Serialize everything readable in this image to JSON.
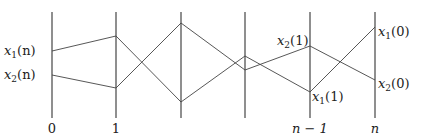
{
  "diagram": {
    "type": "parallel-coordinates / trajectory crossing diagram",
    "axes": [
      {
        "x": 52,
        "label": "0"
      },
      {
        "x": 116,
        "label": "1"
      },
      {
        "x": 181,
        "label": ""
      },
      {
        "x": 245,
        "label": ""
      },
      {
        "x": 310,
        "label": "n − 1"
      },
      {
        "x": 375,
        "label": "n"
      }
    ],
    "axis_top": 12,
    "axis_bottom": 118,
    "series": [
      {
        "name": "path-a",
        "points_y": [
          51,
          36,
          102,
          56,
          92,
          27
        ]
      },
      {
        "name": "path-b",
        "points_y": [
          75,
          88,
          23,
          70,
          46,
          80
        ]
      }
    ],
    "point_labels": {
      "x1n": {
        "var": "x",
        "sub": "1",
        "arg": "(n)"
      },
      "x2n": {
        "var": "x",
        "sub": "2",
        "arg": "(n)"
      },
      "x21": {
        "var": "x",
        "sub": "2",
        "arg": "(1)"
      },
      "x11": {
        "var": "x",
        "sub": "1",
        "arg": "(1)"
      },
      "x10": {
        "var": "x",
        "sub": "1",
        "arg": "(0)"
      },
      "x20": {
        "var": "x",
        "sub": "2",
        "arg": "(0)"
      }
    },
    "colors": {
      "line": "#444444",
      "text": "#222222",
      "background": "#ffffff"
    }
  }
}
